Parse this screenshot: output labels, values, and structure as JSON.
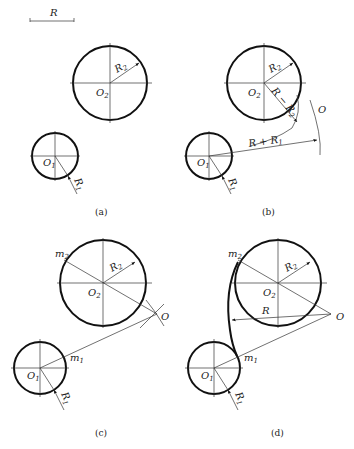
{
  "figure": {
    "scale_bar": {
      "label": "R"
    },
    "panels": [
      {
        "id": "a",
        "caption": "(a)",
        "circle_large": {
          "center_label": "O",
          "center_sub": "2",
          "radius_label": "R",
          "radius_sub": "2"
        },
        "circle_small": {
          "center_label": "O",
          "center_sub": "1",
          "radius_label": "R",
          "radius_sub": "1"
        }
      },
      {
        "id": "b",
        "caption": "(b)",
        "circle_large": {
          "center_label": "O",
          "center_sub": "2",
          "radius_label": "R",
          "radius_sub": "2"
        },
        "circle_small": {
          "center_label": "O",
          "center_sub": "1",
          "radius_label": "R",
          "radius_sub": "1"
        },
        "arc_inner_label": "R − R",
        "arc_inner_sub": "2",
        "arc_outer_label": "R + R",
        "arc_outer_sub": "1",
        "intersection_label": "O"
      },
      {
        "id": "c",
        "caption": "(c)",
        "circle_large": {
          "center_label": "O",
          "center_sub": "2",
          "radius_label": "R",
          "radius_sub": "2"
        },
        "circle_small": {
          "center_label": "O",
          "center_sub": "1",
          "radius_label": "R",
          "radius_sub": "1"
        },
        "tangent_point_1": {
          "label": "m",
          "sub": "1"
        },
        "tangent_point_2": {
          "label": "m",
          "sub": "2"
        },
        "intersection_label": "O"
      },
      {
        "id": "d",
        "caption": "(d)",
        "circle_large": {
          "center_label": "O",
          "center_sub": "2",
          "radius_label": "R",
          "radius_sub": "2"
        },
        "circle_small": {
          "center_label": "O",
          "center_sub": "1",
          "radius_label": "R",
          "radius_sub": "1"
        },
        "tangent_point_1": {
          "label": "m",
          "sub": "1"
        },
        "tangent_point_2": {
          "label": "m",
          "sub": "2"
        },
        "arc_radius_label": "R",
        "intersection_label": "O"
      }
    ]
  }
}
